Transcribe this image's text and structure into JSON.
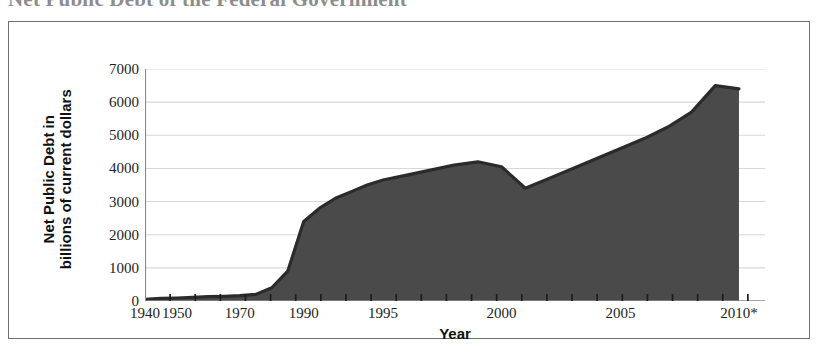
{
  "chart_data": {
    "type": "area",
    "title": "Net Public Debt of the Federal Government",
    "xlabel": "Year",
    "ylabel": "Net Public Debt in billions of current dollars",
    "ylabel_line1": "Net Public Debt in",
    "ylabel_line2": "billions of current dollars",
    "ylim": [
      0,
      7000
    ],
    "ytick_labels": [
      "0",
      "1000",
      "2000",
      "3000",
      "4000",
      "5000",
      "6000",
      "7000"
    ],
    "ytick_values": [
      0,
      1000,
      2000,
      3000,
      4000,
      5000,
      6000,
      7000
    ],
    "xtick_labels": [
      "1940",
      "1950",
      "1970",
      "1990",
      "1995",
      "2000",
      "2005",
      "2010*"
    ],
    "xtick_values": [
      1940,
      1950,
      1970,
      1990,
      1995,
      2000,
      2005,
      2010
    ],
    "grid": "horizontal",
    "legend": "none",
    "area_fill_color": "#4a4a4a",
    "line_color": "#2b2b2b",
    "grid_color": "#d8d8d8",
    "axis_color": "#8a8a8a",
    "x": [
      1940,
      1945,
      1950,
      1955,
      1960,
      1965,
      1970,
      1975,
      1980,
      1985,
      1990,
      1991,
      1992,
      1993,
      1994,
      1995,
      1996,
      1997,
      1998,
      1999,
      2000,
      2001,
      2002,
      2003,
      2004,
      2005,
      2006,
      2007,
      2008,
      2009,
      2010
    ],
    "y": [
      50,
      80,
      90,
      110,
      130,
      140,
      160,
      200,
      400,
      900,
      2400,
      2800,
      3100,
      3300,
      3500,
      3650,
      3800,
      3950,
      4100,
      4200,
      4050,
      3400,
      3700,
      4000,
      4300,
      4600,
      4900,
      5250,
      5700,
      6500,
      6400
    ],
    "series": [
      {
        "name": "Net Public Debt",
        "points": [
          {
            "year": 1940,
            "value": 50
          },
          {
            "year": 1945,
            "value": 80
          },
          {
            "year": 1950,
            "value": 90
          },
          {
            "year": 1955,
            "value": 110
          },
          {
            "year": 1960,
            "value": 130
          },
          {
            "year": 1965,
            "value": 140
          },
          {
            "year": 1970,
            "value": 160
          },
          {
            "year": 1975,
            "value": 200
          },
          {
            "year": 1980,
            "value": 400
          },
          {
            "year": 1985,
            "value": 900
          },
          {
            "year": 1990,
            "value": 2400
          },
          {
            "year": 1991,
            "value": 2800
          },
          {
            "year": 1992,
            "value": 3100
          },
          {
            "year": 1993,
            "value": 3300
          },
          {
            "year": 1994,
            "value": 3500
          },
          {
            "year": 1995,
            "value": 3650
          },
          {
            "year": 1996,
            "value": 3800
          },
          {
            "year": 1997,
            "value": 3950
          },
          {
            "year": 1998,
            "value": 4100
          },
          {
            "year": 1999,
            "value": 4200
          },
          {
            "year": 2000,
            "value": 4050
          },
          {
            "year": 2001,
            "value": 3400
          },
          {
            "year": 2002,
            "value": 3700
          },
          {
            "year": 2003,
            "value": 4000
          },
          {
            "year": 2004,
            "value": 4300
          },
          {
            "year": 2005,
            "value": 4600
          },
          {
            "year": 2006,
            "value": 4900
          },
          {
            "year": 2007,
            "value": 5250
          },
          {
            "year": 2008,
            "value": 5700
          },
          {
            "year": 2009,
            "value": 6500
          },
          {
            "year": 2010,
            "value": 6400
          }
        ]
      }
    ],
    "footnote_marker": "*",
    "minor_tick_count": 24
  }
}
